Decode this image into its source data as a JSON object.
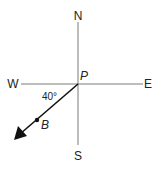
{
  "diagram": {
    "type": "compass-bearing",
    "compass": {
      "north": "N",
      "south": "S",
      "east": "E",
      "west": "W"
    },
    "origin_label": "P",
    "point_label": "B",
    "angle_label": "40°",
    "colors": {
      "axis": "#7a7a7a",
      "arrow": "#111111",
      "text": "#222222"
    }
  }
}
